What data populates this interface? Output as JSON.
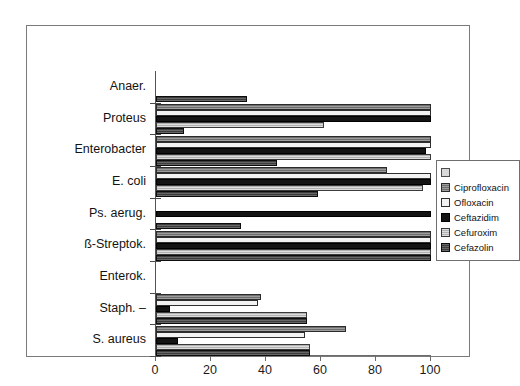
{
  "chart_data": {
    "type": "bar",
    "orientation": "horizontal",
    "title": "",
    "subtitle": "",
    "xlabel": "",
    "ylabel": "",
    "xlim": [
      0,
      100
    ],
    "xticks": [
      0,
      20,
      40,
      60,
      80,
      100
    ],
    "xtick_labels": [
      "0",
      "20",
      "40",
      "60",
      "80",
      "100"
    ],
    "grid": false,
    "legend_position": "right",
    "categories": [
      "Anaer.",
      "Proteus",
      "Enterobacter",
      "E. coli",
      "Ps. aerug.",
      "ß-Streptok.",
      "Enterok.",
      "Staph. –",
      "S. aureus"
    ],
    "series": [
      {
        "name": "",
        "color": "#d9d9d9",
        "values": [
          0,
          0,
          0,
          0,
          0,
          0,
          0,
          0,
          0
        ]
      },
      {
        "name": "Ciprofloxacin",
        "color": "#6e6e6e",
        "values": [
          0,
          100,
          100,
          84,
          0,
          100,
          0,
          38,
          69
        ]
      },
      {
        "name": "Ofloxacin",
        "color": "#f2f2f2",
        "values": [
          0,
          100,
          100,
          100,
          0,
          100,
          0,
          37,
          54
        ]
      },
      {
        "name": "Ceftazidim",
        "color": "#141414",
        "values": [
          0,
          100,
          98,
          100,
          100,
          100,
          0,
          5,
          8
        ]
      },
      {
        "name": "Cefuroxim",
        "color": "#b3b3b3",
        "values": [
          0,
          61,
          100,
          97,
          0,
          100,
          0,
          55,
          56
        ]
      },
      {
        "name": "Cefazolin",
        "color": "#3d3d3d",
        "values": [
          33,
          10,
          44,
          59,
          31,
          100,
          0,
          55,
          56
        ]
      }
    ]
  },
  "legend": {
    "entries": [
      {
        "label": ""
      },
      {
        "label": "Ciprofloxacin"
      },
      {
        "label": "Ofloxacin"
      },
      {
        "label": "Ceftazidim"
      },
      {
        "label": "Cefuroxim"
      },
      {
        "label": "Cefazolin"
      }
    ]
  }
}
